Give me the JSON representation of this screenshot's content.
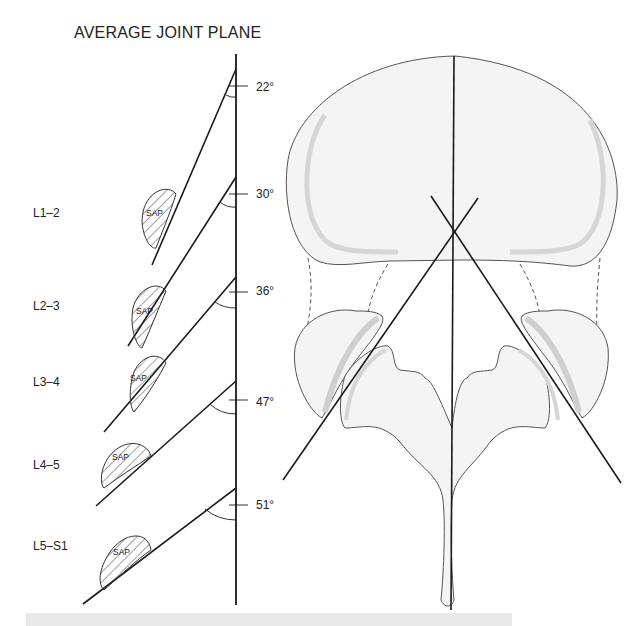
{
  "title": "AVERAGE JOINT PLANE",
  "levels": [
    {
      "label": "L1–2",
      "angle": "22°",
      "sap": "SAP"
    },
    {
      "label": "L2–3",
      "angle": "30°",
      "sap": "SAP"
    },
    {
      "label": "L3–4",
      "angle": "36°",
      "sap": "SAP"
    },
    {
      "label": "L4–5",
      "angle": "47°",
      "sap": "SAP"
    },
    {
      "label": "L5–S1",
      "angle": "51°",
      "sap": "SAP"
    }
  ],
  "colors": {
    "line": "#1a1a1a",
    "bone_fill": "#f4f4f4",
    "cartilage": "#d6d6d6",
    "outline": "#555555",
    "band": "#e9e9e9"
  }
}
